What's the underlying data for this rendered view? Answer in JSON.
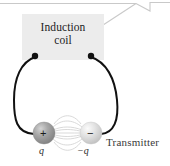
{
  "figure": {
    "background_color": "#ffffff",
    "width": 170,
    "height": 166
  },
  "coil": {
    "box_color": "#ececec",
    "label_line1": "Induction",
    "label_line2": "coil",
    "terminal_left": {
      "x": 35,
      "y": 56
    },
    "terminal_right": {
      "x": 91,
      "y": 56
    },
    "terminal_color": "#111111"
  },
  "leader": {
    "color": "#c9c9c9",
    "description": "callout leader line from coil box to upper right"
  },
  "wires": {
    "color": "#111111",
    "width": 2
  },
  "charges": {
    "positive": {
      "sign": "+",
      "label": "q",
      "cx": 44,
      "cy": 133,
      "r": 11,
      "fill": "#9a9a9a",
      "highlight": "#d8d8d8"
    },
    "negative": {
      "sign": "−",
      "label": "−q",
      "cx": 91,
      "cy": 133,
      "r": 11,
      "fill": "#dcdcdc",
      "highlight": "#f4f4f4"
    },
    "field_line_color": "#d5d5d5"
  },
  "annotations": {
    "transmitter": "Transmitter"
  }
}
